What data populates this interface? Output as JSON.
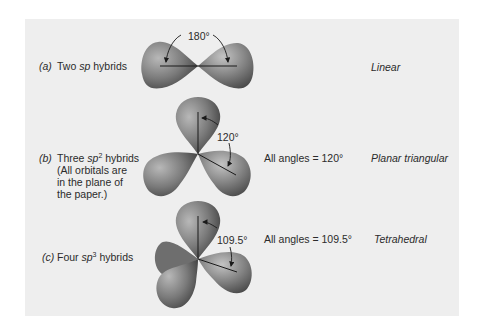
{
  "rows": [
    {
      "letter": "a",
      "description": {
        "pre": "Two ",
        "sp": "sp",
        "sup": "",
        "post": " hybrids"
      },
      "note_lines": [],
      "angle_label": "180°",
      "angles_text": "",
      "geometry": "Linear"
    },
    {
      "letter": "b",
      "description": {
        "pre": "Three ",
        "sp": "sp",
        "sup": "2",
        "post": " hybrids"
      },
      "note_lines": [
        "(All orbitals are",
        "in the plane of",
        "the paper.)"
      ],
      "angle_label": "120°",
      "angles_text": "All angles = 120°",
      "geometry": "Planar triangular"
    },
    {
      "letter": "c",
      "description": {
        "pre": "Four ",
        "sp": "sp",
        "sup": "3",
        "post": " hybrids"
      },
      "note_lines": [],
      "angle_label": "109.5°",
      "angles_text": "All angles = 109.5°",
      "geometry": "Tetrahedral"
    }
  ],
  "colors": {
    "panel_bg": "#eeeeee",
    "orbital_light": "#b5b5b5",
    "orbital_dark": "#4a4a4a",
    "line": "#1a1a1a"
  }
}
